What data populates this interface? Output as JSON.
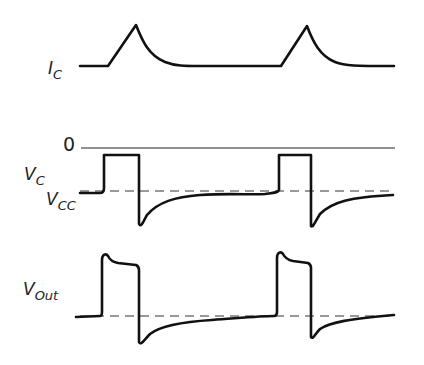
{
  "diagram": {
    "type": "waveform-timing-diagram",
    "traces": [
      {
        "id": "ic",
        "label_main": "I",
        "label_sub": "C",
        "description": "Collector current: flat baseline with triangular ramp up then exponential decay, repeated twice"
      },
      {
        "id": "vc",
        "label_main": "V",
        "label_sub": "C",
        "zero_label": "0",
        "ref_label_main": "V",
        "ref_label_sub": "CC",
        "description": "Collector voltage: rectangular pulse up to 0 level, then negative spike below VCC with exponential recovery, repeated twice"
      },
      {
        "id": "vout",
        "label_main": "V",
        "label_sub": "Out",
        "description": "Output voltage: pulse with overshoot and drooping top, then negative spike with exponential recovery, repeated twice"
      }
    ]
  }
}
